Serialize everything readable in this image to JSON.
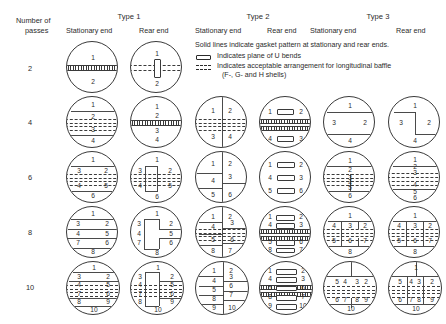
{
  "header": {
    "row_label_line1": "Number of",
    "row_label_line2": "passes",
    "types": [
      {
        "label": "Type 1",
        "stationary": "Stationary end",
        "rear": "Rear end"
      },
      {
        "label": "Type 2",
        "stationary": "Stationary end",
        "rear": "Rear end"
      },
      {
        "label": "Type 3",
        "stationary": "Stationary end",
        "rear": "Rear end"
      }
    ]
  },
  "legend": {
    "note": "Solid lines indicate gasket pattern at stationary and rear ends.",
    "ubend_label": "Indicates plane of U bends",
    "baffle_label_line1": "Indicates acceptable arrangement for longitudinal baffle",
    "baffle_label_line2": "(F-, G- and H shells)",
    "ubend_icon": "rectangle-icon",
    "baffle_icon": "dashed-band-icon"
  },
  "rows": [
    {
      "passes": "2"
    },
    {
      "passes": "4"
    },
    {
      "passes": "6"
    },
    {
      "passes": "8"
    },
    {
      "passes": "10"
    }
  ],
  "colors": {
    "line": "#3a3a3a",
    "text": "#2b2b2b",
    "background": "#ffffff"
  },
  "diagrams": {
    "p2_t1_stat": {
      "nums": [
        "1",
        "2"
      ]
    },
    "p2_t1_rear": {
      "nums": [
        "1",
        "2"
      ]
    },
    "p4_t1_stat": {
      "nums": [
        "1",
        "2",
        "3",
        "4"
      ]
    },
    "p4_t1_rear": {
      "nums": [
        "1",
        "2",
        "3",
        "4"
      ]
    },
    "p4_t2_stat": {
      "nums": [
        "1",
        "2",
        "3",
        "4"
      ]
    },
    "p4_t2_rear": {
      "nums": [
        "1",
        "2",
        "4",
        "3"
      ]
    },
    "p4_t3_stat": {
      "nums": [
        "1",
        "3",
        "2",
        "4"
      ]
    },
    "p4_t3_rear": {
      "nums": [
        "1",
        "3",
        "2",
        "4"
      ]
    },
    "p6_t1_stat": {
      "nums": [
        "1",
        "3",
        "2",
        "4",
        "5",
        "6"
      ]
    },
    "p6_t1_rear": {
      "nums": [
        "1",
        "3",
        "2",
        "4",
        "5",
        "6"
      ]
    },
    "p6_t2_stat": {
      "nums": [
        "1",
        "2",
        "4",
        "3",
        "5",
        "6"
      ]
    },
    "p6_t2_rear": {
      "nums": [
        "1",
        "2",
        "4",
        "3",
        "5",
        "6"
      ]
    },
    "p6_t3_stat": {
      "nums": [
        "1",
        "2",
        "3",
        "4",
        "5",
        "6"
      ]
    },
    "p6_t3_rear": {
      "nums": [
        "1",
        "2",
        "3",
        "4",
        "5",
        "6"
      ]
    },
    "p8_t1_stat": {
      "nums": [
        "1",
        "3",
        "2",
        "4",
        "5",
        "7",
        "6",
        "8"
      ]
    },
    "p8_t1_rear": {
      "nums": [
        "1",
        "3",
        "2",
        "4",
        "5",
        "7",
        "6",
        "8"
      ]
    },
    "p8_t2_stat": {
      "nums": [
        "1",
        "2",
        "4",
        "3",
        "5",
        "6",
        "8",
        "7"
      ]
    },
    "p8_t2_rear": {
      "nums": [
        "1",
        "2",
        "4",
        "3",
        "5",
        "6",
        "8",
        "7"
      ]
    },
    "p8_t3_stat": {
      "nums": [
        "1",
        "4",
        "3",
        "2",
        "5",
        "6",
        "7",
        "8"
      ]
    },
    "p8_t3_rear": {
      "nums": [
        "1",
        "4",
        "3",
        "2",
        "5",
        "6",
        "7",
        "8"
      ]
    },
    "p10_t1_stat": {
      "nums": [
        "1",
        "3",
        "2",
        "4",
        "5",
        "7",
        "6",
        "8",
        "9",
        "10"
      ]
    },
    "p10_t1_rear": {
      "nums": [
        "1",
        "3",
        "2",
        "4",
        "5",
        "7",
        "6",
        "8",
        "9",
        "10"
      ]
    },
    "p10_t2_stat": {
      "nums": [
        "1",
        "2",
        "4",
        "3",
        "5",
        "6",
        "8",
        "7",
        "9",
        "10"
      ]
    },
    "p10_t2_rear": {
      "nums": [
        "1",
        "2",
        "4",
        "3",
        "5",
        "6",
        "8",
        "7",
        "9",
        "10"
      ]
    },
    "p10_t3_stat": {
      "nums": [
        "5",
        "4",
        "3",
        "2",
        "6",
        "7",
        "8",
        "9",
        "10"
      ]
    },
    "p10_t3_rear": {
      "nums": [
        "1",
        "5",
        "4",
        "3",
        "2",
        "6",
        "7",
        "8",
        "9",
        "10"
      ]
    }
  }
}
